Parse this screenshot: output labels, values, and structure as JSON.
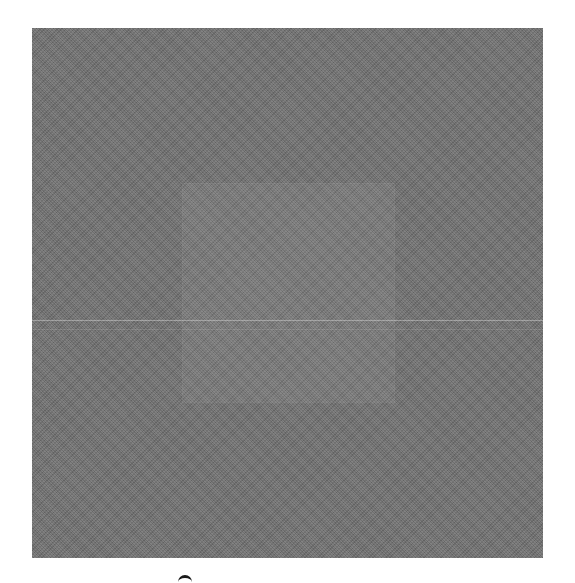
{
  "image": {
    "description": "Grayscale textured material swatch",
    "background_color": "#ffffff",
    "swatch": {
      "color": "#6f6f6f",
      "texture": "fine woven noise"
    },
    "inner_patch": {
      "tone": "slightly lighter gray"
    },
    "crease_lines": [
      {
        "name": "primary-crease",
        "tone": "light gray"
      },
      {
        "name": "secondary-crease",
        "tone": "faint gray"
      }
    ],
    "bottom_mark": {
      "shape": "partially cropped circle",
      "color": "#1a1a1a"
    }
  }
}
